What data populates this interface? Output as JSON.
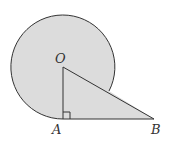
{
  "diagram": {
    "labels": {
      "center": "O",
      "tangent_point": "A",
      "external_point": "B"
    },
    "colors": {
      "fill": "#dcdcdc",
      "stroke": "#333333",
      "background": "#ffffff"
    }
  }
}
